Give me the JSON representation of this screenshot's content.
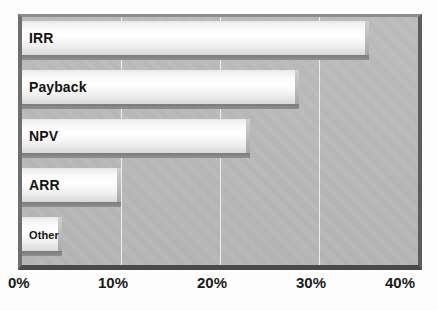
{
  "chart_data": {
    "type": "bar",
    "orientation": "horizontal",
    "title": "",
    "xlabel": "",
    "ylabel": "",
    "categories": [
      "IRR",
      "Payback",
      "NPV",
      "ARR",
      "Other"
    ],
    "values": [
      35,
      28,
      23,
      10,
      4
    ],
    "value_suffix": "%",
    "xlim": [
      0,
      40
    ],
    "xticks": [
      0,
      10,
      20,
      30,
      40
    ],
    "xtick_labels": [
      "0%",
      "10%",
      "20%",
      "30%",
      "40%"
    ],
    "grid": true,
    "grid_axis": "x",
    "legend": false,
    "series": [
      {
        "name": "Usage",
        "values": [
          35,
          28,
          23,
          10,
          4
        ]
      }
    ],
    "style": {
      "plot_background": "#b9b9b9",
      "bar_fill_light": "#ffffff",
      "bar_fill_dark": "#d8d8d8",
      "bar_shadow": "#7c7c7c",
      "gridline_color": "#f2f2f2",
      "frame_color": "#5c5c5c",
      "text_color": "#141414"
    }
  },
  "axis": {
    "ticks": [
      {
        "label": "0%",
        "value": 0
      },
      {
        "label": "10%",
        "value": 10
      },
      {
        "label": "20%",
        "value": 20
      },
      {
        "label": "30%",
        "value": 30
      },
      {
        "label": "40%",
        "value": 40
      }
    ]
  },
  "bars": [
    {
      "label": "IRR",
      "value": 35,
      "label_size": "large"
    },
    {
      "label": "Payback",
      "value": 28,
      "label_size": "large"
    },
    {
      "label": "NPV",
      "value": 23,
      "label_size": "large"
    },
    {
      "label": "ARR",
      "value": 10,
      "label_size": "large"
    },
    {
      "label": "Other",
      "value": 4,
      "label_size": "small"
    }
  ],
  "caption": {
    "text": ""
  }
}
